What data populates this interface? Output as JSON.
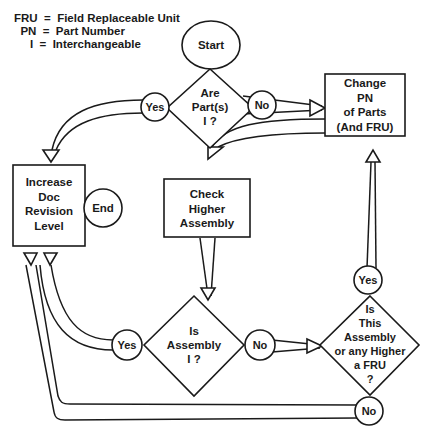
{
  "legend": [
    {
      "abbr": "FRU",
      "eq": "=",
      "meaning": "Field Replaceable Unit"
    },
    {
      "abbr": "PN",
      "eq": "=",
      "meaning": "Part Number"
    },
    {
      "abbr": "I",
      "eq": "=",
      "meaning": "Interchangeable"
    }
  ],
  "legend_rows": [
    "FRU  =  Field Replaceable Unit",
    "  PN  =  Part Number",
    "     I  =  Interchangeable"
  ],
  "nodes": {
    "start": {
      "type": "terminator",
      "label": "Start"
    },
    "end": {
      "type": "terminator",
      "label": "End"
    },
    "decision_parts_i": {
      "type": "decision",
      "lines": [
        "Are",
        "Part(s)",
        "I ?"
      ]
    },
    "change_pn": {
      "type": "process",
      "lines": [
        "Change",
        "PN",
        "of Parts",
        "(And FRU)"
      ]
    },
    "increase_doc": {
      "type": "process",
      "lines": [
        "Increase",
        "Doc",
        "Revision",
        "Level"
      ]
    },
    "check_higher": {
      "type": "process",
      "lines": [
        "Check",
        "Higher",
        "Assembly"
      ]
    },
    "decision_assembly_i": {
      "type": "decision",
      "lines": [
        "Is",
        "Assembly",
        "I ?"
      ]
    },
    "decision_fru": {
      "type": "decision",
      "lines": [
        "Is",
        "This",
        "Assembly",
        "or any Higher",
        "a FRU",
        "?"
      ]
    }
  },
  "edge_labels": {
    "parts_yes": "Yes",
    "parts_no": "No",
    "assembly_yes": "Yes",
    "assembly_no": "No",
    "fru_yes": "Yes",
    "fru_no": "No"
  },
  "edges": [
    {
      "from": "start",
      "to": "decision_parts_i"
    },
    {
      "from": "decision_parts_i",
      "to": "increase_doc",
      "label": "Yes"
    },
    {
      "from": "decision_parts_i",
      "to": "change_pn",
      "label": "No"
    },
    {
      "from": "change_pn",
      "to": "check_higher"
    },
    {
      "from": "check_higher",
      "to": "decision_assembly_i"
    },
    {
      "from": "decision_assembly_i",
      "to": "increase_doc",
      "label": "Yes"
    },
    {
      "from": "decision_assembly_i",
      "to": "decision_fru",
      "label": "No"
    },
    {
      "from": "decision_fru",
      "to": "change_pn",
      "label": "Yes"
    },
    {
      "from": "decision_fru",
      "to": "increase_doc",
      "label": "No"
    }
  ]
}
